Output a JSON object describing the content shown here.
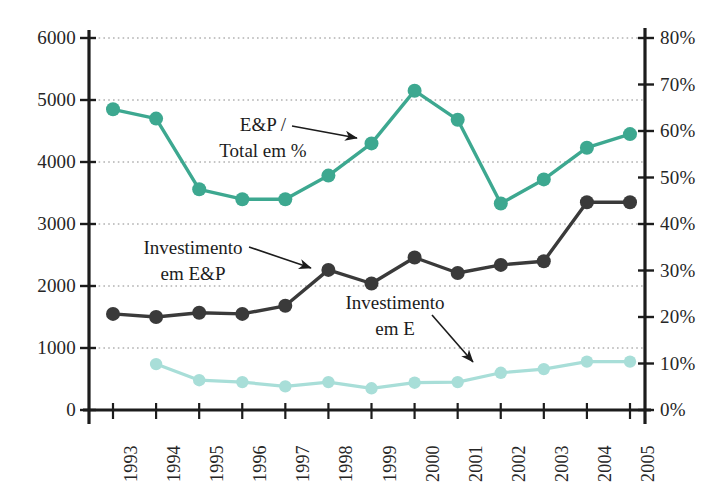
{
  "chart_data": {
    "type": "line",
    "title": "",
    "subtitle": "",
    "xlabel": "",
    "ylabel": "",
    "y2label": "",
    "grid": true,
    "legend_position": "inline-annotations",
    "categories": [
      "1993",
      "1994",
      "1995",
      "1996",
      "1997",
      "1998",
      "1999",
      "2000",
      "2001",
      "2002",
      "2003",
      "2004",
      "2005"
    ],
    "ylim": [
      0,
      6000
    ],
    "y2lim": [
      0,
      80
    ],
    "yticks": [
      "0",
      "1000",
      "2000",
      "3000",
      "4000",
      "5000",
      "6000"
    ],
    "y2ticks": [
      "0%",
      "10%",
      "20%",
      "30%",
      "40%",
      "50%",
      "60%",
      "70%",
      "80%"
    ],
    "series": [
      {
        "name": "E&P / Total em %",
        "axis": "right",
        "color": "#3da890",
        "values": [
          64.7,
          62.7,
          47.5,
          45.3,
          45.3,
          50.4,
          57.3,
          68.6,
          62.4,
          44.4,
          49.6,
          56.4,
          59.3
        ],
        "values_left_scale": [
          4850,
          4700,
          3560,
          3400,
          3400,
          3780,
          4300,
          5150,
          4680,
          3330,
          3720,
          4230,
          4450
        ]
      },
      {
        "name": "Investimento em E&P",
        "axis": "left",
        "color": "#3a3a3a",
        "values": [
          1550,
          1500,
          1570,
          1550,
          1680,
          2260,
          2040,
          2460,
          2210,
          2340,
          2400,
          3350,
          3350
        ]
      },
      {
        "name": "Investimento em E",
        "axis": "left",
        "color": "#a8ded8",
        "values": [
          null,
          740,
          480,
          450,
          380,
          450,
          350,
          440,
          450,
          600,
          660,
          780,
          780
        ]
      }
    ],
    "annotations": [
      {
        "id": "ep-total",
        "line1": "E&P /",
        "line2": "Total em %"
      },
      {
        "id": "inv-ep",
        "line1": "Investimento",
        "line2": "em E&P"
      },
      {
        "id": "inv-e",
        "line1": "Investimento",
        "line2": "em E"
      }
    ]
  }
}
